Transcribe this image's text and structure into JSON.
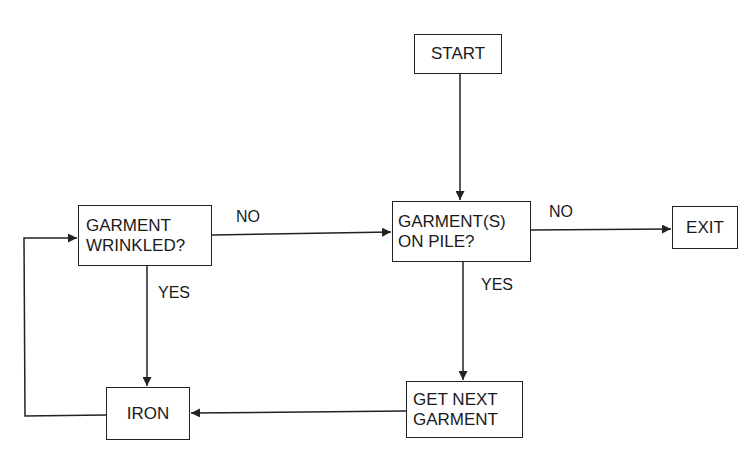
{
  "diagram": {
    "type": "flowchart",
    "nodes": {
      "start": "START",
      "wrinkled": "GARMENT\nWRINKLED?",
      "on_pile": "GARMENT(S)\nON PILE?",
      "exit": "EXIT",
      "iron": "IRON",
      "get_next": "GET NEXT\nGARMENT"
    },
    "edge_labels": {
      "wrinkled_no": "NO",
      "wrinkled_yes": "YES",
      "on_pile_no": "NO",
      "on_pile_yes": "YES"
    },
    "edges": [
      {
        "from": "START",
        "to": "GARMENT(S) ON PILE?"
      },
      {
        "from": "GARMENT(S) ON PILE?",
        "to": "EXIT",
        "label": "NO"
      },
      {
        "from": "GARMENT(S) ON PILE?",
        "to": "GET NEXT GARMENT",
        "label": "YES"
      },
      {
        "from": "GET NEXT GARMENT",
        "to": "IRON"
      },
      {
        "from": "IRON",
        "to": "GARMENT WRINKLED?"
      },
      {
        "from": "GARMENT WRINKLED?",
        "to": "IRON",
        "label": "YES"
      },
      {
        "from": "GARMENT WRINKLED?",
        "to": "GARMENT(S) ON PILE?",
        "label": "NO"
      }
    ]
  }
}
